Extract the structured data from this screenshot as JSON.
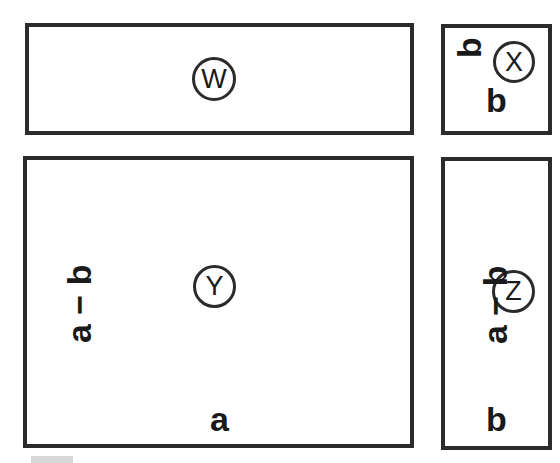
{
  "figure": {
    "background_color": "#ffffff",
    "stroke_color": "#2b2b2b",
    "text_color": "#1a1a1a"
  },
  "regions": [
    {
      "key": "w",
      "letter": "W",
      "shape": "rectangle",
      "position": "top-left",
      "width_label": "",
      "height_label": ""
    },
    {
      "key": "x",
      "letter": "X",
      "shape": "rectangle",
      "position": "top-right",
      "width_label": "b",
      "height_label": "b"
    },
    {
      "key": "y",
      "letter": "Y",
      "shape": "rectangle",
      "position": "bottom-left",
      "width_label": "a",
      "height_label": "a − b"
    },
    {
      "key": "z",
      "letter": "Z",
      "shape": "rectangle",
      "position": "bottom-right",
      "width_label": "b",
      "height_label": "a − b"
    }
  ],
  "labels": {
    "w_letter": "W",
    "x_letter": "X",
    "y_letter": "Y",
    "z_letter": "Z",
    "y_height": "a − b",
    "y_width": "a",
    "x_height": "b",
    "x_width": "b",
    "z_height": "a − b",
    "z_width": "b"
  }
}
